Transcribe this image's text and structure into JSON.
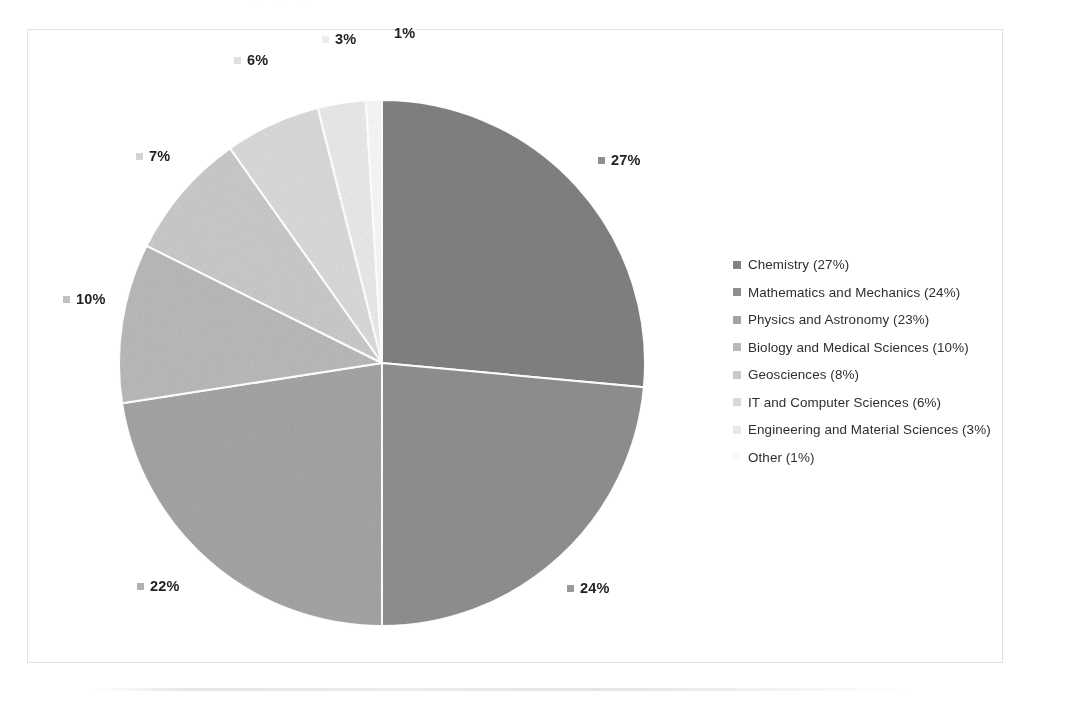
{
  "chart_data": {
    "type": "pie",
    "title": "",
    "start_angle_deg": 0,
    "direction": "clockwise",
    "legend_position": "right",
    "grid": false,
    "categories": [
      "Chemistry",
      "Mathematics and Mechanics",
      "Physics and Astronomy",
      "Biology and Medical Sciences",
      "Geosciences",
      "IT and Computer Sciences",
      "Engineering and Material Sciences",
      "Other"
    ],
    "values": [
      27,
      24,
      23,
      10,
      8,
      6,
      3,
      1
    ],
    "unit": "%",
    "slice_labels": [
      "27%",
      "24%",
      "22%",
      "10%",
      "7%",
      "6%",
      "3%",
      "1%"
    ],
    "slice_label_values": [
      27,
      24,
      22,
      10,
      7,
      6,
      3,
      1
    ],
    "colors": [
      "#808080",
      "#8e8e8e",
      "#a3a3a3",
      "#b8b8b8",
      "#c8c8c8",
      "#d8d8d8",
      "#e8e8e8",
      "#f5f5f5"
    ]
  },
  "labels": {
    "pct_27": "27%",
    "pct_24": "24%",
    "pct_22": "22%",
    "pct_10": "10%",
    "pct_7": "7%",
    "pct_6": "6%",
    "pct_3": "3%",
    "pct_1": "1%"
  },
  "legend": {
    "items": [
      {
        "text": "Chemistry (27%)",
        "color": "#808080"
      },
      {
        "text": "Mathematics and Mechanics (24%)",
        "color": "#8e8e8e"
      },
      {
        "text": "Physics and Astronomy (23%)",
        "color": "#a3a3a3"
      },
      {
        "text": "Biology and Medical Sciences (10%)",
        "color": "#b8b8b8"
      },
      {
        "text": "Geosciences (8%)",
        "color": "#c8c8c8"
      },
      {
        "text": "IT and Computer Sciences (6%)",
        "color": "#d8d8d8"
      },
      {
        "text": "Engineering and Material Sciences (3%)",
        "color": "#e8e8e8"
      },
      {
        "text": "Other (1%)",
        "color": "#fafafa"
      }
    ]
  },
  "artifacts": {
    "top_bleed": "·  ·   ·    ·            ·     ·"
  }
}
